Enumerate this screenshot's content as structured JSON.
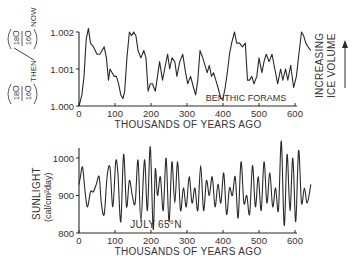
{
  "chart_data": [
    {
      "type": "line",
      "title": "",
      "annotation": "BENTHIC FORAMS",
      "side_label": [
        "INCREASING",
        "ICE VOLUME"
      ],
      "xlabel": "THOUSANDS OF YEARS AGO",
      "ylabel": "(18O/16O)THEN / (18O/16O)NOW",
      "xlim": [
        0,
        650
      ],
      "ylim": [
        1.0,
        1.002
      ],
      "xticks": [
        "0",
        "100",
        "200",
        "300",
        "400",
        "500",
        "600"
      ],
      "yticks": [
        "1.000",
        "1.001",
        "1.002"
      ],
      "grid": false,
      "series": [
        {
          "name": "Benthic forams δ18O ratio",
          "x": [
            0,
            8,
            14,
            20,
            26,
            32,
            40,
            50,
            58,
            64,
            70,
            76,
            82,
            86,
            92,
            98,
            104,
            110,
            116,
            122,
            127,
            133,
            140,
            146,
            152,
            158,
            164,
            172,
            180,
            186,
            192,
            198,
            204,
            212,
            218,
            224,
            232,
            238,
            246,
            252,
            258,
            266,
            272,
            280,
            288,
            296,
            302,
            310,
            318,
            324,
            330,
            336,
            344,
            350,
            356,
            362,
            368,
            374,
            380,
            386,
            394,
            400,
            406,
            412,
            418,
            424,
            432,
            438,
            446,
            454,
            462,
            468,
            474,
            480,
            486,
            494,
            500,
            508,
            514,
            520,
            528,
            536,
            544,
            552,
            560,
            566,
            574,
            580,
            588,
            596,
            604,
            612,
            618,
            624,
            630,
            636,
            644
          ],
          "values": [
            1.0,
            1.0003,
            1.0008,
            1.0018,
            1.0021,
            1.0017,
            1.0016,
            1.0014,
            1.0014,
            1.0015,
            1.0016,
            1.0013,
            1.0007,
            1.001,
            1.0009,
            1.0008,
            1.0008,
            1.0006,
            1.0003,
            1.0002,
            1.0004,
            1.0013,
            1.002,
            1.0019,
            1.002,
            1.0019,
            1.0015,
            1.0013,
            1.0015,
            1.0013,
            1.0004,
            1.0006,
            1.0006,
            1.0004,
            1.0008,
            1.0012,
            1.0007,
            1.001,
            1.0014,
            1.001,
            1.0013,
            1.0012,
            1.0008,
            1.0012,
            1.0014,
            1.0009,
            1.0006,
            1.0008,
            1.0005,
            1.0003,
            1.0007,
            1.0015,
            1.0013,
            1.0011,
            1.0009,
            1.0011,
            1.0008,
            1.0009,
            1.0007,
            1.0005,
            1.0002,
            1.0002,
            1.0005,
            1.0009,
            1.0014,
            1.0017,
            1.002,
            1.0017,
            1.0017,
            1.0016,
            1.0017,
            1.0007,
            1.0007,
            1.0008,
            1.0006,
            1.0008,
            1.0013,
            1.0009,
            1.0012,
            1.0014,
            1.0012,
            1.0014,
            1.001,
            1.0006,
            1.001,
            1.0007,
            1.001,
            1.0007,
            1.0011,
            1.0005,
            1.0008,
            1.0015,
            1.002,
            1.0019,
            1.0017,
            1.0016,
            1.0015
          ]
        }
      ]
    },
    {
      "type": "line",
      "title": "",
      "annotation": "JULY 65°N",
      "xlabel": "THOUSANDS OF YEARS AGO",
      "ylabel": "SUNLIGHT (cal/cm2day)",
      "xlim": [
        0,
        650
      ],
      "ylim": [
        800,
        1050
      ],
      "xticks": [
        "0",
        "100",
        "200",
        "300",
        "400",
        "500",
        "600"
      ],
      "yticks": [
        "800",
        "900",
        "1000"
      ],
      "grid": false,
      "series": [
        {
          "name": "July insolation 65°N",
          "x": [
            0,
            4,
            10,
            18,
            24,
            32,
            40,
            48,
            56,
            62,
            70,
            78,
            86,
            94,
            102,
            108,
            116,
            124,
            132,
            140,
            148,
            156,
            164,
            172,
            182,
            190,
            198,
            206,
            212,
            218,
            226,
            234,
            242,
            250,
            258,
            266,
            274,
            282,
            290,
            298,
            306,
            314,
            322,
            330,
            338,
            346,
            354,
            362,
            370,
            378,
            386,
            394,
            402,
            410,
            418,
            426,
            434,
            442,
            450,
            458,
            466,
            474,
            482,
            490,
            498,
            506,
            514,
            522,
            530,
            538,
            546,
            554,
            562,
            570,
            578,
            586,
            594,
            602,
            610,
            618,
            626,
            634,
            644
          ],
          "values": [
            930,
            950,
            975,
            900,
            870,
            910,
            910,
            930,
            950,
            880,
            850,
            950,
            975,
            870,
            990,
            960,
            830,
            1010,
            870,
            940,
            900,
            880,
            995,
            830,
            995,
            860,
            1030,
            810,
            970,
            900,
            950,
            860,
            1000,
            830,
            990,
            880,
            990,
            860,
            920,
            870,
            950,
            880,
            920,
            860,
            980,
            860,
            940,
            900,
            950,
            870,
            930,
            880,
            960,
            850,
            920,
            900,
            950,
            840,
            990,
            880,
            900,
            850,
            980,
            870,
            950,
            860,
            990,
            880,
            960,
            870,
            920,
            860,
            1045,
            820,
            1010,
            860,
            1000,
            830,
            1020,
            880,
            920,
            880,
            930
          ]
        }
      ]
    }
  ],
  "top_chart": {
    "yticks": [
      "1.000",
      "1.001",
      "1.002"
    ],
    "xticks": [
      "0",
      "100",
      "200",
      "300",
      "400",
      "500",
      "600"
    ],
    "xlabel": "THOUSANDS OF YEARS AGO",
    "annotation": "BENTHIC FORAMS",
    "side_label_1": "INCREASING",
    "side_label_2": "ICE VOLUME",
    "ylabel": {
      "num1": "18",
      "sym1": "O",
      "den1": "16",
      "sym1b": "O",
      "then": "THEN",
      "num2": "18",
      "sym2": "O",
      "den2": "16",
      "sym2b": "O",
      "now": "NOW"
    }
  },
  "bottom_chart": {
    "yticks": [
      "800",
      "900",
      "1000"
    ],
    "xticks": [
      "0",
      "100",
      "200",
      "300",
      "400",
      "500",
      "600"
    ],
    "xlabel": "THOUSANDS OF YEARS AGO",
    "annotation": "JULY 65°N",
    "ylabel_1": "SUNLIGHT",
    "ylabel_2": "(cal/cm²day)"
  }
}
